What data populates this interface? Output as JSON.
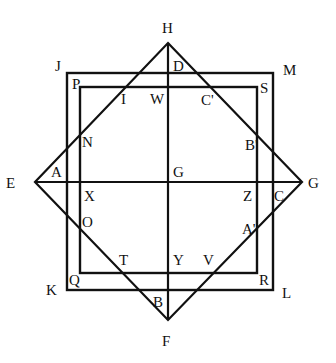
{
  "diagram": {
    "type": "geometry",
    "stroke_color": "#111111",
    "vertices": {
      "H": [
        168,
        43
      ],
      "E": [
        35,
        182
      ],
      "G": [
        302,
        182
      ],
      "F": [
        168,
        320
      ]
    },
    "outer_rect": {
      "x1": 67,
      "y1": 73,
      "x2": 273,
      "y2": 290,
      "corners": [
        "J",
        "M",
        "L",
        "K"
      ]
    },
    "inner_rect": {
      "x1": 80,
      "y1": 87,
      "x2": 257,
      "y2": 273,
      "corners": [
        "P",
        "S",
        "R",
        "Q"
      ]
    },
    "axes": {
      "vertical": [
        "H",
        "F"
      ],
      "horizontal": [
        "E",
        "G"
      ],
      "center": "G"
    },
    "labels": [
      {
        "t": "H",
        "x": 162,
        "y": 33
      },
      {
        "t": "J",
        "x": 55,
        "y": 71
      },
      {
        "t": "M",
        "x": 283,
        "y": 75
      },
      {
        "t": "D",
        "x": 173,
        "y": 71
      },
      {
        "t": "P",
        "x": 72,
        "y": 89
      },
      {
        "t": "S",
        "x": 260,
        "y": 93
      },
      {
        "t": "I",
        "x": 121,
        "y": 104
      },
      {
        "t": "W",
        "x": 150,
        "y": 104
      },
      {
        "t": "C'",
        "x": 201,
        "y": 105
      },
      {
        "t": "N",
        "x": 82,
        "y": 147
      },
      {
        "t": "B'",
        "x": 245,
        "y": 150
      },
      {
        "t": "E",
        "x": 6,
        "y": 188
      },
      {
        "t": "A",
        "x": 51,
        "y": 177
      },
      {
        "t": "G",
        "x": 173,
        "y": 177
      },
      {
        "t": "G",
        "x": 308,
        "y": 188
      },
      {
        "t": "X",
        "x": 84,
        "y": 201
      },
      {
        "t": "Z",
        "x": 243,
        "y": 201
      },
      {
        "t": "C",
        "x": 274,
        "y": 201
      },
      {
        "t": "O",
        "x": 82,
        "y": 227
      },
      {
        "t": "A'",
        "x": 242,
        "y": 234
      },
      {
        "t": "T",
        "x": 119,
        "y": 265
      },
      {
        "t": "Y",
        "x": 173,
        "y": 265
      },
      {
        "t": "V",
        "x": 203,
        "y": 265
      },
      {
        "t": "Q",
        "x": 69,
        "y": 285
      },
      {
        "t": "R",
        "x": 259,
        "y": 285
      },
      {
        "t": "K",
        "x": 46,
        "y": 295
      },
      {
        "t": "L",
        "x": 282,
        "y": 298
      },
      {
        "t": "B",
        "x": 153,
        "y": 307
      },
      {
        "t": "F",
        "x": 162,
        "y": 346
      }
    ]
  }
}
